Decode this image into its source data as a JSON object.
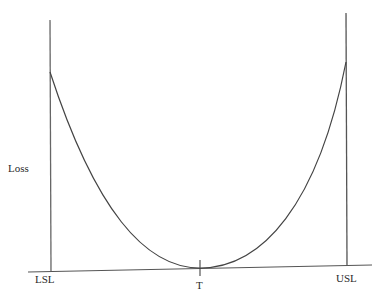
{
  "diagram": {
    "type": "quadratic loss function",
    "y_axis_label": "Loss",
    "x_markers": [
      {
        "label": "LSL",
        "meaning": "lower specification limit"
      },
      {
        "label": "T",
        "meaning": "target"
      },
      {
        "label": "USL",
        "meaning": "upper specification limit"
      }
    ],
    "curve": "parabola with minimum at T, rising to meet vertical lines at LSL and USL",
    "colors": {
      "line": "#555555",
      "curve": "#444444",
      "text": "#2a2a2a",
      "background": "#ffffff"
    }
  },
  "labels": {
    "loss": "Loss",
    "lsl": "LSL",
    "t": "T",
    "usl": "USL"
  }
}
